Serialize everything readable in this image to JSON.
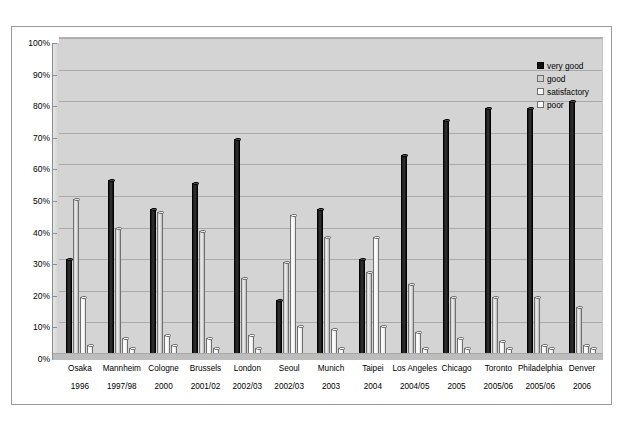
{
  "chart_data": {
    "type": "bar",
    "title": "",
    "xlabel": "",
    "ylabel": "",
    "ylim": [
      0,
      100
    ],
    "ytick_labels": [
      "0%",
      "10%",
      "20%",
      "30%",
      "40%",
      "50%",
      "60%",
      "70%",
      "80%",
      "90%",
      "100%"
    ],
    "ytick_values": [
      0,
      10,
      20,
      30,
      40,
      50,
      60,
      70,
      80,
      90,
      100
    ],
    "grid": true,
    "legend_position": "top-right",
    "categories": [
      "Osaka",
      "Mannheim",
      "Cologne",
      "Brussels",
      "London",
      "Seoul",
      "Munich",
      "Taipei",
      "Los Angeles",
      "Chicago",
      "Toronto",
      "Philadelphia",
      "Denver"
    ],
    "category_years": [
      "1996",
      "1997/98",
      "2000",
      "2001/02",
      "2002/03",
      "2002/03",
      "2003",
      "2004",
      "2004/05",
      "2005",
      "2005/06",
      "2005/06",
      "2006"
    ],
    "series": [
      {
        "name": "very good",
        "color": "#111111",
        "values": [
          30,
          55,
          46,
          54,
          68,
          17,
          46,
          30,
          63,
          74,
          78,
          78,
          80
        ]
      },
      {
        "name": "good",
        "color": "#cfcfcf",
        "values": [
          49,
          40,
          45,
          39,
          24,
          29,
          37,
          26,
          22,
          18,
          18,
          18,
          15
        ]
      },
      {
        "name": "satisfactory",
        "color": "#ffffff",
        "values": [
          18,
          5,
          6,
          5,
          6,
          44,
          8,
          37,
          7,
          5,
          4,
          3,
          3
        ]
      },
      {
        "name": "poor",
        "color": "#ffffff",
        "values": [
          3,
          2,
          3,
          2,
          2,
          9,
          2,
          9,
          2,
          2,
          2,
          2,
          2
        ]
      }
    ]
  },
  "legend": {
    "items": [
      {
        "label": "very good",
        "swatch": "sw-verygood"
      },
      {
        "label": "good",
        "swatch": "sw-good"
      },
      {
        "label": "satisfactory",
        "swatch": "sw-satisfactory"
      },
      {
        "label": "poor",
        "swatch": "sw-poor"
      }
    ]
  },
  "caption": ""
}
